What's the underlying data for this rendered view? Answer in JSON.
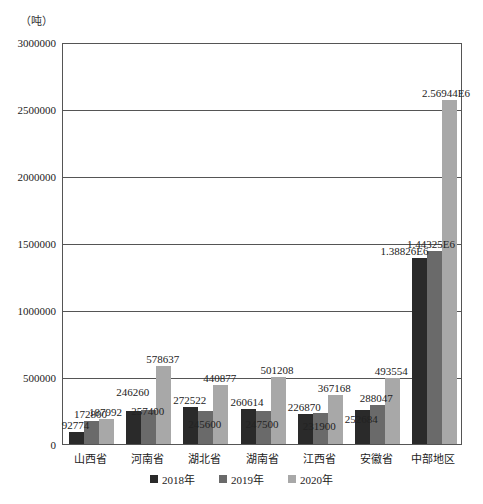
{
  "chart_data": {
    "type": "bar",
    "title": "",
    "unit_label": "（吨）",
    "xlabel": "",
    "ylabel": "（吨）",
    "ylim": [
      0,
      3000000
    ],
    "yticks": [
      "0",
      "500000",
      "1000000",
      "1500000",
      "2000000",
      "2500000",
      "3000000"
    ],
    "grid": true,
    "legend_position": "bottom",
    "categories": [
      "山西省",
      "河南省",
      "湖北省",
      "湖南省",
      "江西省",
      "安徽省",
      "中部地区"
    ],
    "series": [
      {
        "name": "2018年",
        "color": "#2a2a2a",
        "values": [
          92774,
          246260,
          272522,
          260614,
          226870,
          252684,
          1388260
        ],
        "labels": [
          "92774",
          "246260",
          "272522",
          "260614",
          "226870",
          "252684",
          "1.38826E6"
        ]
      },
      {
        "name": "2019年",
        "color": "#6a6a6a",
        "values": [
          172800,
          257400,
          245600,
          247500,
          231900,
          288047,
          1443250
        ],
        "labels": [
          "172800",
          "257400",
          "245600",
          "247500",
          "231900",
          "288047",
          "1.44325E6"
        ]
      },
      {
        "name": "2020年",
        "color": "#a8a8a8",
        "values": [
          187992,
          578637,
          440877,
          501208,
          367168,
          493554,
          2569440
        ],
        "labels": [
          "187992",
          "578637",
          "440877",
          "501208",
          "367168",
          "493554",
          "2.56944E6"
        ]
      }
    ]
  }
}
